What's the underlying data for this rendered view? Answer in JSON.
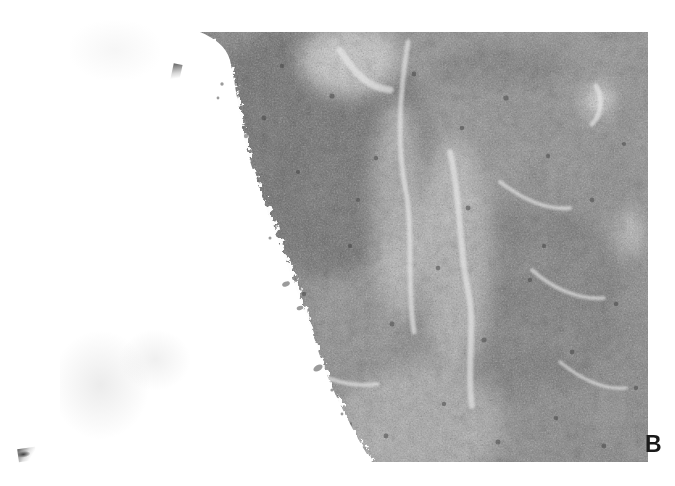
{
  "figure": {
    "domain": "micrograph",
    "panel_label": "B",
    "background_color": "#ffffff",
    "page_width": 675,
    "page_height": 486
  },
  "micrograph": {
    "plate": {
      "x": 200,
      "y": 32,
      "width": 448,
      "height": 430
    },
    "description": "Low-power grayscale histology micrograph of lymphoid tissue; dense cellular parenchyma occupying the right and upper portion, with the tissue capsule/edge running diagonally from upper-left to lower-right and blank white slide background to its left.",
    "stain_tone": "grayscale",
    "tone_colors": {
      "blank_slide": "#ffffff",
      "pale_cleft": "#e8e8e8",
      "light_parenchyma": "#b9b9b9",
      "mid_parenchyma": "#8e8e8e",
      "dense_follicle": "#6e6e6e",
      "darkest_nuclei": "#3c3c3c"
    },
    "regions": [
      {
        "name": "dense-lymphoid-follicle",
        "tone": "dense_follicle",
        "cx": 310,
        "cy": 150,
        "rx": 120,
        "ry": 125
      },
      {
        "name": "pale-sinus-cleft-upper",
        "tone": "pale_cleft",
        "cx": 352,
        "cy": 60,
        "rx": 46,
        "ry": 34
      },
      {
        "name": "pale-sinus-cleft-diagonal",
        "tone": "pale_cleft",
        "cx": 398,
        "cy": 210,
        "rx": 26,
        "ry": 110
      },
      {
        "name": "pale-sinus-cleft-central",
        "tone": "pale_cleft",
        "cx": 455,
        "cy": 250,
        "rx": 36,
        "ry": 120
      },
      {
        "name": "secondary-dense-nodule",
        "tone": "dense_follicle",
        "cx": 520,
        "cy": 300,
        "rx": 100,
        "ry": 95
      },
      {
        "name": "pale-zone-lower-left",
        "tone": "light_parenchyma",
        "cx": 420,
        "cy": 420,
        "rx": 80,
        "ry": 60
      },
      {
        "name": "pale-window-right",
        "tone": "pale_cleft",
        "cx": 598,
        "cy": 100,
        "rx": 14,
        "ry": 16
      }
    ],
    "tissue_edge": {
      "name": "capsular-boundary",
      "note": "Irregular tissue margin; blank slide to the left of the path.",
      "points": [
        [
          200,
          32
        ],
        [
          206,
          58
        ],
        [
          216,
          88
        ],
        [
          214,
          120
        ],
        [
          222,
          150
        ],
        [
          232,
          178
        ],
        [
          244,
          206
        ],
        [
          252,
          232
        ],
        [
          266,
          258
        ],
        [
          276,
          284
        ],
        [
          286,
          308
        ],
        [
          292,
          332
        ],
        [
          300,
          352
        ],
        [
          312,
          372
        ],
        [
          326,
          392
        ],
        [
          340,
          412
        ],
        [
          352,
          432
        ],
        [
          364,
          450
        ],
        [
          372,
          462
        ]
      ]
    }
  },
  "artifacts": [
    {
      "name": "corner-speck",
      "x": 18,
      "y": 448,
      "note": "small dark ink/dust mark at lower-left of page"
    },
    {
      "name": "edge-speck",
      "x": 172,
      "y": 64,
      "note": "small dark fleck just left of the plate edge"
    },
    {
      "name": "smudge-left",
      "x": 60,
      "y": 330,
      "note": "very faint gray smudge on blank area"
    },
    {
      "name": "smudge-mid",
      "x": 120,
      "y": 330,
      "note": "very faint gray smudge on blank area"
    },
    {
      "name": "smudge-top",
      "x": 70,
      "y": 20,
      "note": "very faint gray smudge on blank area"
    }
  ]
}
